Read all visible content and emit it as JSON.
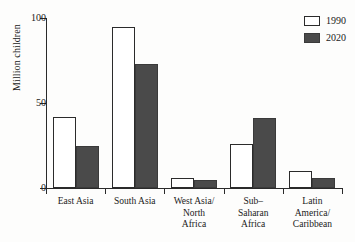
{
  "chart_data": {
    "type": "bar",
    "title": "",
    "subtitle": "",
    "xlabel": "",
    "ylabel": "Million children",
    "ylim": [
      0,
      100
    ],
    "yticks": [
      0,
      50,
      100
    ],
    "ytick_labels": [
      "0",
      "50",
      "100"
    ],
    "grid": false,
    "legend_position": "top-right",
    "categories": [
      "East Asia",
      "South Asia",
      "West Asia/\nNorth\nAfrica",
      "Sub–\nSaharan\nAfrica",
      "Latin\nAmerica/\nCaribbean"
    ],
    "series": [
      {
        "name": "1990",
        "color": "#ffffff",
        "values": [
          42,
          95,
          6,
          26,
          10
        ]
      },
      {
        "name": "2020",
        "color": "#4a4a4a",
        "values": [
          25,
          73,
          5,
          41,
          6
        ]
      }
    ]
  },
  "legend": {
    "entries": [
      {
        "label": "1990"
      },
      {
        "label": "2020"
      }
    ]
  },
  "axis": {
    "y_label": "Million children",
    "y_tick_0": "0",
    "y_tick_50": "50",
    "y_tick_100": "100"
  }
}
